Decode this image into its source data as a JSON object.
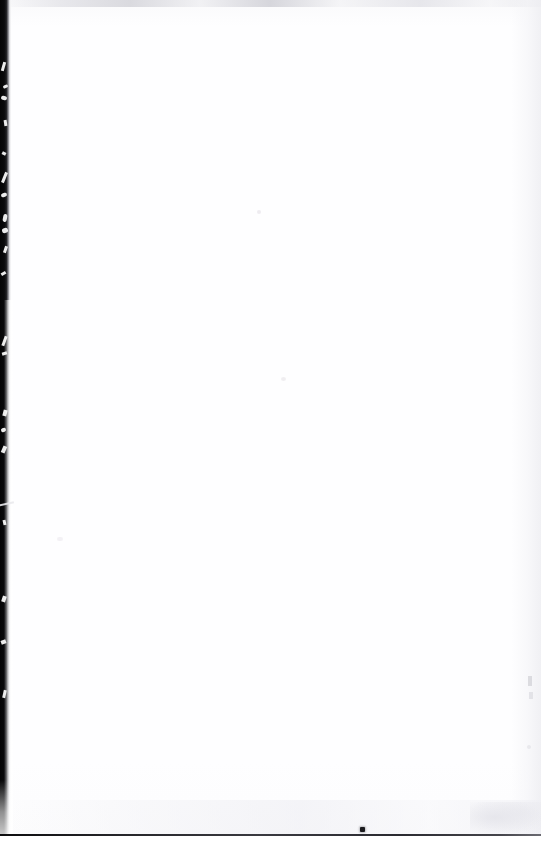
{
  "document": {
    "kind": "scanned-page",
    "page_content_text": "",
    "page_state_label": "Blank page",
    "background_color": "#ffffff",
    "paper_tone_color": "#fefeff"
  },
  "artifacts": {
    "left_edge": {
      "name": "left-binding-shadow",
      "color": "#050506",
      "width_px": "11",
      "description": "Dark vertical scanner/binding edge band with white scratch streaks"
    },
    "top_edge": {
      "name": "top-edge-smudge",
      "color": "#d4d4da",
      "height_px": "7"
    },
    "right_edge": {
      "name": "right-edge-haze",
      "color": "#eeeef2",
      "width_px": "30"
    },
    "bottom_rule": {
      "name": "bottom-hairline-rule",
      "color": "#26262a",
      "height_px": "2",
      "y_px": "834"
    },
    "speck": {
      "name": "ink-speck",
      "color": "#1a1a1e",
      "x_px": "362",
      "y_px": "829",
      "size_px": "5"
    },
    "bleed": {
      "name": "bottom-right-bleed-through",
      "color": "#e4e4ea"
    }
  }
}
